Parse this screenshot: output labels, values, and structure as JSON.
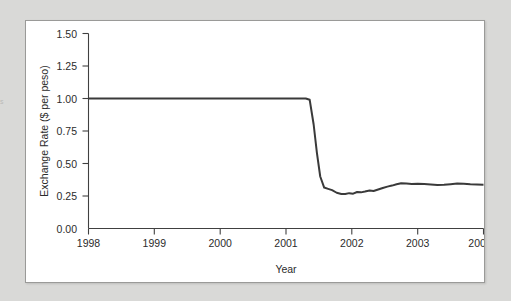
{
  "page": {
    "background_color": "#d9d9d7",
    "panel_background_color": "#ffffff",
    "panel_border_color": "#9a9a98",
    "edge_sliver_text": "s"
  },
  "chart_data": {
    "type": "line",
    "title": "",
    "subtitle": "",
    "xlabel": "Year",
    "ylabel": "Exchange Rate ($ per peso)",
    "xlim": [
      1998,
      2004
    ],
    "ylim": [
      0.0,
      1.5
    ],
    "xticks": [
      1998,
      1999,
      2000,
      2001,
      2002,
      2003,
      2004
    ],
    "xtick_labels": [
      "1998",
      "1999",
      "2000",
      "2001",
      "2002",
      "2003",
      "2004"
    ],
    "yticks": [
      0.0,
      0.25,
      0.5,
      0.75,
      1.0,
      1.25,
      1.5
    ],
    "ytick_labels": [
      "0.00",
      "0.25",
      "0.50",
      "0.75",
      "1.00",
      "1.25",
      "1.50"
    ],
    "grid": false,
    "legend": false,
    "legend_position": "none",
    "line_color": "#3a3a3a",
    "line_width": 2,
    "series": [
      {
        "name": "Exchange Rate ($ per peso)",
        "x": [
          1998.0,
          1998.25,
          1998.5,
          1998.75,
          1999.0,
          1999.25,
          1999.5,
          1999.75,
          2000.0,
          2000.25,
          2000.5,
          2000.75,
          2001.0,
          2001.15,
          2001.3,
          2001.36,
          2001.42,
          2001.47,
          2001.52,
          2001.58,
          2001.64,
          2001.7,
          2001.77,
          2001.84,
          2001.9,
          2001.96,
          2002.02,
          2002.08,
          2002.14,
          2002.2,
          2002.27,
          2002.33,
          2002.4,
          2002.47,
          2002.54,
          2002.61,
          2002.68,
          2002.75,
          2002.83,
          2002.91,
          2003.0,
          2003.1,
          2003.2,
          2003.3,
          2003.4,
          2003.5,
          2003.6,
          2003.7,
          2003.8,
          2003.9,
          2004.0
        ],
        "y": [
          1.0,
          1.0,
          1.0,
          1.0,
          1.0,
          1.0,
          1.0,
          1.0,
          1.0,
          1.0,
          1.0,
          1.0,
          1.0,
          1.0,
          1.0,
          0.99,
          0.8,
          0.58,
          0.4,
          0.315,
          0.305,
          0.295,
          0.275,
          0.265,
          0.265,
          0.272,
          0.268,
          0.281,
          0.278,
          0.284,
          0.292,
          0.288,
          0.3,
          0.312,
          0.322,
          0.33,
          0.34,
          0.348,
          0.347,
          0.343,
          0.345,
          0.342,
          0.338,
          0.335,
          0.336,
          0.341,
          0.346,
          0.344,
          0.34,
          0.338,
          0.337
        ]
      }
    ],
    "annotations": [],
    "notes": {
      "plateau_value": 1.0,
      "plateau_end_year": 2001.36,
      "crash_low_value": 0.26,
      "final_value": 0.34
    }
  }
}
